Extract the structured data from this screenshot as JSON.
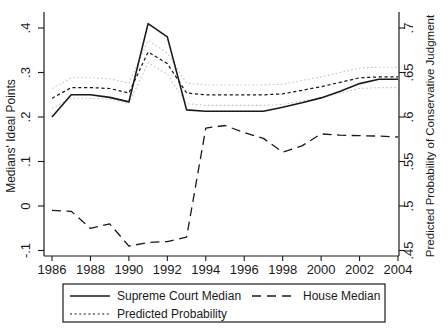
{
  "figure": {
    "background": "#ffffff",
    "line_color": "#1a1a1a",
    "confidence_band_color": "#c3c3c3"
  },
  "chart_data": {
    "type": "line",
    "title": "",
    "x": [
      1986,
      1987,
      1988,
      1989,
      1990,
      1991,
      1992,
      1993,
      1994,
      1995,
      1996,
      1997,
      1998,
      1999,
      2000,
      2001,
      2002,
      2003,
      2004
    ],
    "x_axis": {
      "tick_values": [
        1986,
        1988,
        1990,
        1992,
        1994,
        1996,
        1998,
        2000,
        2002,
        2004
      ],
      "tick_labels": [
        "1986",
        "1988",
        "1990",
        "1992",
        "1994",
        "1996",
        "1998",
        "2000",
        "2002",
        "2004"
      ],
      "range": [
        1985.6,
        2004.4
      ],
      "grid": false
    },
    "left_axis": {
      "label": "Medians' Ideal Points",
      "tick_values": [
        -0.1,
        0,
        0.1,
        0.2,
        0.3,
        0.4
      ],
      "tick_labels": [
        "-.1",
        "0",
        ".1",
        ".2",
        ".3",
        ".4"
      ],
      "range": [
        -0.112,
        0.436
      ]
    },
    "right_axis": {
      "label": "Predicted Probability of Conservative Judgment",
      "tick_values": [
        0.45,
        0.5,
        0.55,
        0.6,
        0.65,
        0.7
      ],
      "tick_labels": [
        ".45",
        ".5",
        ".55",
        ".6",
        ".65",
        ".7"
      ],
      "range": [
        0.444,
        0.718
      ]
    },
    "series": [
      {
        "name": "Supreme Court Median",
        "axis": "left",
        "style": "solid",
        "color": "#1a1a1a",
        "in_legend": true,
        "values": [
          0.2,
          0.25,
          0.25,
          0.244,
          0.234,
          0.41,
          0.38,
          0.216,
          0.213,
          0.213,
          0.213,
          0.213,
          0.222,
          0.232,
          0.243,
          0.258,
          0.275,
          0.285,
          0.285
        ]
      },
      {
        "name": "House Median",
        "axis": "left",
        "style": "long-dash",
        "color": "#1a1a1a",
        "in_legend": true,
        "values": [
          -0.01,
          -0.012,
          -0.05,
          -0.04,
          -0.09,
          -0.082,
          -0.08,
          -0.07,
          0.175,
          0.181,
          0.165,
          0.152,
          0.121,
          0.135,
          0.162,
          0.159,
          0.158,
          0.157,
          0.155
        ]
      },
      {
        "name": "Predicted Probability",
        "axis": "right",
        "style": "short-dash",
        "color": "#1a1a1a",
        "in_legend": true,
        "values": [
          0.621,
          0.633,
          0.633,
          0.632,
          0.627,
          0.673,
          0.66,
          0.627,
          0.625,
          0.625,
          0.625,
          0.625,
          0.626,
          0.63,
          0.634,
          0.639,
          0.644,
          0.645,
          0.645
        ]
      },
      {
        "name": "Confidence Band Upper",
        "axis": "right",
        "style": "dotted",
        "color": "#c3c3c3",
        "in_legend": false,
        "values": [
          0.632,
          0.644,
          0.644,
          0.643,
          0.638,
          0.686,
          0.672,
          0.638,
          0.636,
          0.636,
          0.636,
          0.636,
          0.637,
          0.641,
          0.645,
          0.65,
          0.655,
          0.656,
          0.656
        ]
      },
      {
        "name": "Confidence Band Lower",
        "axis": "right",
        "style": "dotted",
        "color": "#c3c3c3",
        "in_legend": false,
        "values": [
          0.61,
          0.621,
          0.621,
          0.62,
          0.615,
          0.661,
          0.648,
          0.615,
          0.613,
          0.613,
          0.613,
          0.613,
          0.614,
          0.618,
          0.622,
          0.627,
          0.632,
          0.633,
          0.633
        ]
      }
    ],
    "legend": {
      "position": "bottom",
      "entries": [
        "Supreme Court Median",
        "House Median",
        "Predicted Probability"
      ]
    }
  }
}
